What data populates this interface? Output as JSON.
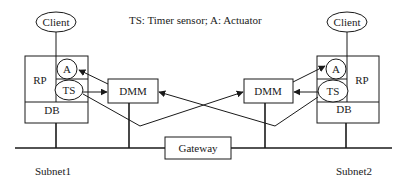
{
  "legend": {
    "text": "TS: Timer sensor; A: Actuator"
  },
  "left_node": {
    "client_label": "Client",
    "rp_label": "RP",
    "db_label": "DB",
    "actuator_label": "A",
    "sensor_label": "TS",
    "dmm_label": "DMM",
    "subnet_label": "Subnet1"
  },
  "right_node": {
    "client_label": "Client",
    "rp_label": "RP",
    "db_label": "DB",
    "actuator_label": "A",
    "sensor_label": "TS",
    "dmm_label": "DMM",
    "subnet_label": "Subnet2"
  },
  "gateway": {
    "label": "Gateway"
  },
  "colors": {
    "line": "#1a1a1a",
    "background": "#ffffff"
  }
}
